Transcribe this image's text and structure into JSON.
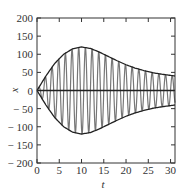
{
  "chart_data": {
    "type": "line",
    "title": "",
    "xlabel": "t",
    "ylabel": "x",
    "xlim": [
      0,
      31
    ],
    "ylim": [
      -200,
      200
    ],
    "grid": false,
    "legend": null,
    "xticks": [
      0,
      5,
      10,
      15,
      20,
      25,
      30
    ],
    "yticks": [
      200,
      150,
      100,
      50,
      0,
      -50,
      -100,
      -150,
      -200
    ],
    "xtick_labels": [
      "0",
      "5",
      "10",
      "15",
      "20",
      "25",
      "30"
    ],
    "ytick_labels": [
      "200",
      "150",
      "100",
      "50",
      "0",
      "− 50",
      "− 100",
      "− 150",
      "− 200"
    ],
    "series": [
      {
        "name": "upper envelope",
        "color": "#222222",
        "x": [
          0,
          2,
          4,
          6,
          8,
          10,
          12,
          14,
          16,
          18,
          20,
          22,
          24,
          26,
          28,
          31
        ],
        "y": [
          0,
          40,
          75,
          100,
          115,
          120,
          116,
          106,
          94,
          82,
          71,
          62,
          55,
          49,
          45,
          40
        ]
      },
      {
        "name": "lower envelope",
        "color": "#222222",
        "x": [
          0,
          2,
          4,
          6,
          8,
          10,
          12,
          14,
          16,
          18,
          20,
          22,
          24,
          26,
          28,
          31
        ],
        "y": [
          0,
          -40,
          -75,
          -100,
          -115,
          -120,
          -116,
          -106,
          -94,
          -82,
          -71,
          -62,
          -55,
          -49,
          -45,
          -40
        ]
      },
      {
        "name": "oscillation",
        "color": "#777777",
        "period": 1.5,
        "note": "fast oscillation bounded by the envelope"
      },
      {
        "name": "zero line",
        "color": "#222222",
        "x": [
          0,
          31
        ],
        "y": [
          0,
          0
        ]
      }
    ]
  }
}
